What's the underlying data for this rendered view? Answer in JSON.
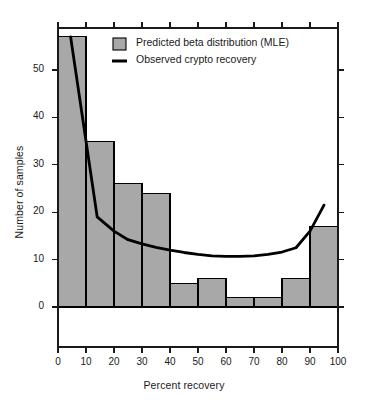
{
  "chart_data": {
    "type": "bar",
    "title": "",
    "xlabel": "Percent recovery",
    "ylabel": "Number of samples",
    "xlim": [
      0,
      100
    ],
    "ylim": [
      0,
      57
    ],
    "xticks": [
      0,
      10,
      20,
      30,
      40,
      50,
      60,
      70,
      80,
      90,
      100
    ],
    "yticks": [
      0,
      10,
      20,
      30,
      40,
      50
    ],
    "grid": false,
    "legend_position": "top-center",
    "bin_width": 10,
    "categories": [
      "0-10",
      "10-20",
      "20-30",
      "30-40",
      "40-50",
      "50-60",
      "60-70",
      "70-80",
      "80-90",
      "90-100"
    ],
    "bin_edges": [
      0,
      10,
      20,
      30,
      40,
      50,
      60,
      70,
      80,
      90,
      100
    ],
    "values": [
      57,
      35,
      26,
      24,
      5,
      6,
      2,
      2,
      6,
      17
    ],
    "series": [
      {
        "name": "Predicted beta distribution (MLE)",
        "type": "bar",
        "color": "#a8a8a8",
        "edge_color": "#000000",
        "values": [
          57,
          35,
          26,
          24,
          5,
          6,
          2,
          2,
          6,
          17
        ]
      },
      {
        "name": "Observed crypto recovery",
        "type": "line",
        "color": "#000000",
        "x": [
          4.5,
          14,
          20,
          25,
          30,
          35,
          40,
          45,
          50,
          55,
          60,
          65,
          70,
          75,
          80,
          85,
          90,
          95
        ],
        "y": [
          57,
          19,
          16,
          14.2,
          13.3,
          12.6,
          12,
          11.5,
          11.1,
          10.8,
          10.7,
          10.7,
          10.8,
          11.1,
          11.6,
          12.5,
          16,
          21.5
        ]
      }
    ],
    "legend": [
      {
        "label": "Predicted beta distribution (MLE)",
        "marker": "filled-square",
        "color": "#a8a8a8"
      },
      {
        "label": "Observed crypto recovery",
        "marker": "line",
        "color": "#000000"
      }
    ],
    "annotations": []
  },
  "colors": {
    "bar_fill": "#a8a8a8",
    "bar_edge": "#000000",
    "line": "#000000",
    "axis": "#1a1a1a",
    "background": "#ffffff"
  }
}
